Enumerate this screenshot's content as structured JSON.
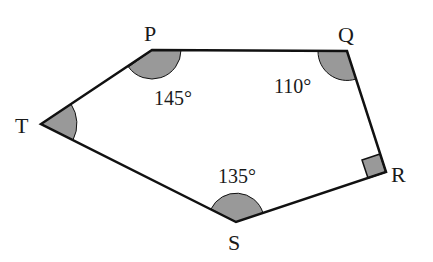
{
  "figure": {
    "type": "pentagon",
    "stroke_color": "#111111",
    "shade_color": "#999999",
    "vertices": [
      {
        "name": "P",
        "x": 152,
        "y": 50
      },
      {
        "name": "Q",
        "x": 347,
        "y": 51
      },
      {
        "name": "R",
        "x": 386,
        "y": 172
      },
      {
        "name": "S",
        "x": 236,
        "y": 222
      },
      {
        "name": "T",
        "x": 41,
        "y": 124
      }
    ],
    "labels": {
      "P": "P",
      "Q": "Q",
      "R": "R",
      "S": "S",
      "T": "T"
    },
    "angles": {
      "P": "145°",
      "Q": "110°",
      "S": "135°",
      "R": "right-angle",
      "T": "unknown"
    }
  }
}
